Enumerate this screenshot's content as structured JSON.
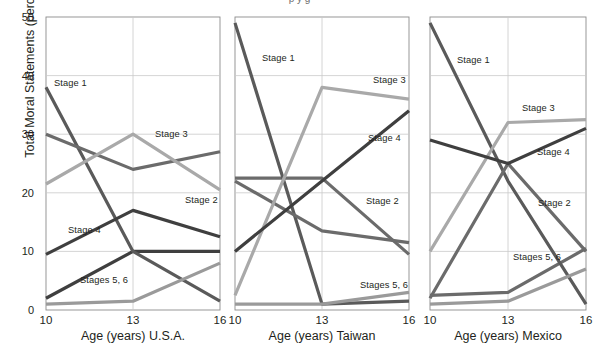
{
  "figure": {
    "title_partial": "p                                                                              y  g",
    "ylabel": "Total Moral Statements (percent)",
    "y_ticks": [
      "0",
      "10",
      "20",
      "30",
      "40",
      "50"
    ],
    "x_ticks": [
      "10",
      "13",
      "16"
    ]
  },
  "panels": [
    {
      "id": "usa",
      "caption": "Age (years) U.S.A."
    },
    {
      "id": "taiwan",
      "caption": "Age (years) Taiwan"
    },
    {
      "id": "mexico",
      "caption": "Age (years) Mexico"
    }
  ],
  "series_labels": {
    "stage1": "Stage 1",
    "stage2": "Stage 2",
    "stage3": "Stage 3",
    "stage4": "Stage 4",
    "stage56": "Stages 5, 6"
  },
  "colors": {
    "stage1": "#5a5a5a",
    "stage2": "#6b6b6b",
    "stage3": "#a9a9a9",
    "stage4": "#3f3f3f",
    "stage56": "#9a9a9a",
    "axis": "#8c8c8c",
    "grid": "#c9c9c9",
    "text": "#231f20"
  },
  "chart_data": {
    "type": "line",
    "xlabel": "Age (years)",
    "ylabel": "Total Moral Statements (percent)",
    "x": [
      10,
      13,
      16
    ],
    "xlim": [
      10,
      16
    ],
    "ylim": [
      0,
      50
    ],
    "yticks": [
      0,
      10,
      20,
      30,
      40,
      50
    ],
    "grid": true,
    "legend": "inline-labels",
    "panels": [
      {
        "name": "U.S.A.",
        "series": [
          {
            "name": "Stage 1",
            "values": [
              38.0,
              10.0,
              1.5
            ]
          },
          {
            "name": "Stage 2",
            "values": [
              30.0,
              24.0,
              27.0
            ]
          },
          {
            "name": "Stage 3",
            "values": [
              21.5,
              30.0,
              20.5
            ]
          },
          {
            "name": "Stage 4",
            "values": [
              9.5,
              17.0,
              12.5
            ]
          },
          {
            "name": "Stages 5, 6",
            "values": [
              1.0,
              1.5,
              8.0
            ]
          }
        ],
        "extra_flat_series": {
          "name": "Stage 4 plateau",
          "values": [
            2.0,
            10.0,
            10.0
          ]
        }
      },
      {
        "name": "Taiwan",
        "series": [
          {
            "name": "Stage 1",
            "values": [
              49.0,
              1.0,
              1.5
            ]
          },
          {
            "name": "Stage 2",
            "values": [
              22.0,
              13.5,
              11.5
            ]
          },
          {
            "name": "Stage 3",
            "values": [
              2.5,
              38.0,
              36.0
            ]
          },
          {
            "name": "Stage 4",
            "values": [
              10.0,
              22.0,
              34.0
            ]
          },
          {
            "name": "Stages 5, 6",
            "values": [
              1.0,
              1.0,
              3.0
            ]
          }
        ],
        "extra_flat_series": {
          "name": "Stage 2 plateau",
          "values": [
            22.5,
            22.5,
            9.5
          ]
        }
      },
      {
        "name": "Mexico",
        "series": [
          {
            "name": "Stage 1",
            "values": [
              49.0,
              22.0,
              1.0
            ]
          },
          {
            "name": "Stage 2",
            "values": [
              2.0,
              25.0,
              10.0
            ]
          },
          {
            "name": "Stage 3",
            "values": [
              10.0,
              32.0,
              32.5
            ]
          },
          {
            "name": "Stage 4",
            "values": [
              29.0,
              25.0,
              31.0
            ]
          },
          {
            "name": "Stages 5, 6",
            "values": [
              1.0,
              1.5,
              7.0
            ]
          }
        ],
        "extra_flat_series": {
          "name": "Stage 2 plateau",
          "values": [
            2.5,
            3.0,
            10.5
          ]
        }
      }
    ]
  }
}
